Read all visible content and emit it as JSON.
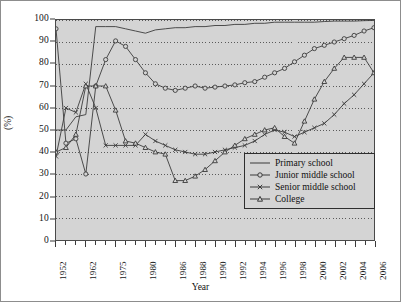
{
  "chart_data": {
    "type": "line",
    "title": "",
    "xlabel": "Year",
    "ylabel": "(%)",
    "ylim": [
      0,
      100
    ],
    "ytick_step": 10,
    "yticks": [
      0,
      10,
      20,
      30,
      40,
      50,
      60,
      70,
      80,
      90,
      100
    ],
    "grid": "horizontal-dotted",
    "legend_position": "bottom-right-inside",
    "x_axis_type": "categorical-evenly-spaced",
    "x_tick_labels": [
      "1952",
      "1962",
      "1975",
      "1980",
      "1986",
      "1988",
      "1990",
      "1992",
      "1994",
      "1996",
      "1998",
      "2000",
      "2002",
      "2004",
      "2006"
    ],
    "x_tick_label_indices": [
      0,
      3,
      6,
      9,
      12,
      14,
      16,
      18,
      20,
      22,
      24,
      26,
      28,
      30,
      32
    ],
    "x_total_ticks": 33,
    "x_categories": [
      "1952",
      "1957",
      "1960",
      "1962",
      "1965",
      "1970",
      "1975",
      "1977",
      "1978",
      "1980",
      "1982",
      "1984",
      "1986",
      "1987",
      "1988",
      "1989",
      "1990",
      "1991",
      "1992",
      "1993",
      "1994",
      "1995",
      "1996",
      "1997",
      "1998",
      "1999",
      "2000",
      "2001",
      "2002",
      "2003",
      "2004",
      "2005",
      "2006"
    ],
    "series": [
      {
        "name": "Primary school",
        "marker": "none",
        "color": "#3a3a3a",
        "values": [
          50,
          50,
          56,
          57,
          97,
          97,
          97,
          96,
          95,
          94,
          95.5,
          96,
          96.5,
          96.5,
          97,
          97,
          97.5,
          97.5,
          98,
          98,
          98.5,
          98.5,
          99,
          99,
          99,
          99,
          99,
          99.3,
          99.5,
          99.5,
          99.5,
          99.7,
          99.8
        ]
      },
      {
        "name": "Junior middle school",
        "marker": "circle",
        "color": "#3a3a3a",
        "values": [
          96,
          44,
          46,
          30,
          70,
          82,
          90.5,
          88,
          82,
          76,
          71,
          69,
          68,
          69,
          70,
          69,
          69.5,
          70,
          70.5,
          71.5,
          72,
          74,
          76,
          78,
          81,
          84,
          87,
          88.5,
          90,
          91.5,
          93,
          95,
          96.5,
          99
        ]
      },
      {
        "name": "Senior middle school",
        "marker": "x",
        "color": "#3a3a3a",
        "values": [
          38,
          60,
          58,
          71,
          60,
          43,
          43,
          43,
          43,
          48,
          45,
          43,
          41,
          40,
          39,
          39,
          40,
          41,
          42,
          43,
          45,
          48,
          50,
          49,
          47,
          49,
          51,
          53,
          57,
          62,
          66,
          71,
          76
        ]
      },
      {
        "name": "College",
        "marker": "triangle",
        "color": "#3a3a3a",
        "values": [
          40,
          42,
          48,
          70,
          70,
          70,
          59,
          45,
          44,
          42,
          40,
          39,
          27,
          27,
          29,
          32,
          36,
          40,
          43,
          46,
          48,
          50,
          51,
          47,
          44,
          54,
          64,
          72,
          78,
          83,
          83,
          83,
          76
        ]
      }
    ]
  },
  "legend": {
    "items": [
      {
        "label": "Primary school",
        "marker": "none"
      },
      {
        "label": "Junior middle school",
        "marker": "circle"
      },
      {
        "label": "Senior middle school",
        "marker": "x"
      },
      {
        "label": "College",
        "marker": "triangle"
      }
    ]
  },
  "axes": {
    "y_title": "(%)",
    "x_title": "Year"
  }
}
